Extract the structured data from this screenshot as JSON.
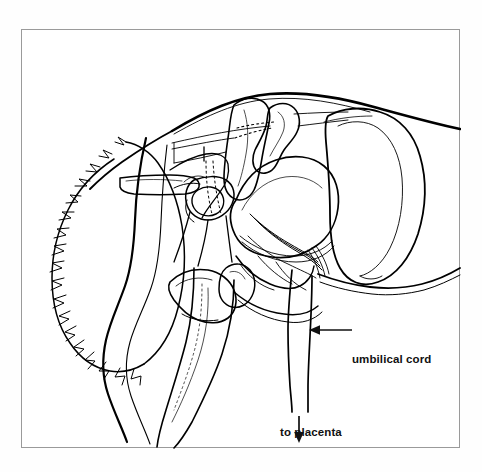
{
  "figure": {
    "domain": "diagram",
    "kind": "anatomical-line-drawing",
    "frame": {
      "border_color": "#9a9a9a",
      "background_color": "#ffffff",
      "page_background_color": "#fefefe",
      "x": 21,
      "y": 29,
      "width": 439,
      "height": 419
    },
    "ink_color": "#000000",
    "annotations": [
      {
        "id": "umbilical-cord",
        "label": "umbilical cord",
        "arrow": "left-arrow",
        "arrow_direction": "left",
        "text_x": 330,
        "text_y": 323,
        "arrow_from_x": 345,
        "arrow_to_x": 310,
        "arrow_y": 330
      },
      {
        "id": "to-placenta",
        "label": "to placenta",
        "arrow": "down-arrow",
        "arrow_direction": "down",
        "text_x": 258,
        "text_y": 396,
        "arrow_x": 296,
        "arrow_from_y": 416,
        "arrow_to_y": 441
      }
    ]
  }
}
